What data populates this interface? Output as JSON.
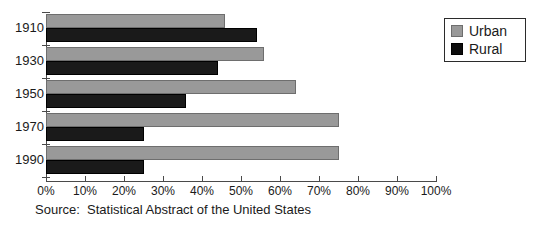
{
  "chart_data": {
    "type": "bar",
    "orientation": "horizontal",
    "title": "",
    "subtitle": "",
    "xlabel": "",
    "ylabel": "",
    "categories": [
      "1910",
      "1930",
      "1950",
      "1970",
      "1990"
    ],
    "series": [
      {
        "name": "Urban",
        "color": "#999999",
        "values": [
          46,
          56,
          64,
          75,
          75
        ]
      },
      {
        "name": "Rural",
        "color": "#0d0d0d",
        "values": [
          54,
          44,
          36,
          25,
          25
        ]
      }
    ],
    "xlim": [
      0,
      100
    ],
    "xtick_values": [
      0,
      10,
      20,
      30,
      40,
      50,
      60,
      70,
      80,
      90,
      100
    ],
    "xtick_labels": [
      "0%",
      "10%",
      "20%",
      "30%",
      "40%",
      "50%",
      "60%",
      "70%",
      "80%",
      "90%",
      "100%"
    ],
    "grid": false,
    "legend_position": "top-right",
    "legend_entries": [
      "Urban",
      "Rural"
    ],
    "annotations": [
      "Source:  Statistical Abstract of the United States"
    ]
  },
  "legend": {
    "urban_label": "Urban",
    "rural_label": "Rural"
  },
  "source": {
    "text": "Source:  Statistical Abstract of the United States"
  },
  "colors": {
    "urban": "#999999",
    "rural": "#0d0d0d",
    "axis": "#4a4a4a",
    "text": "#1a1a1a",
    "background": "#ffffff"
  }
}
